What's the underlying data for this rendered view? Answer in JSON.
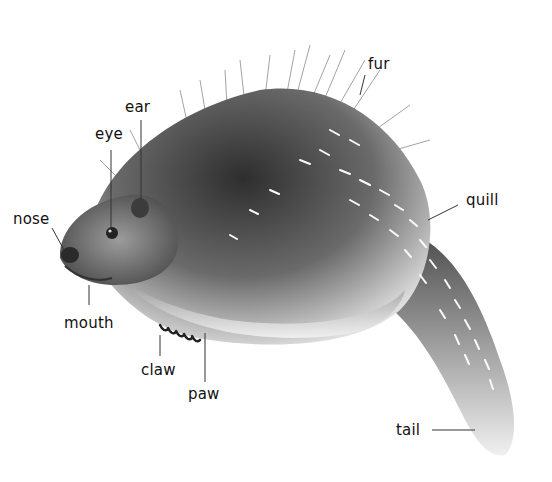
{
  "diagram": {
    "labels": {
      "fur": "fur",
      "ear": "ear",
      "eye": "eye",
      "nose": "nose",
      "quill": "quill",
      "mouth": "mouth",
      "claw": "claw",
      "paw": "paw",
      "tail": "tail"
    },
    "colors": {
      "background": "#ffffff",
      "ink": "#111111",
      "body_dark": "#3a3a3a",
      "body_light": "#d8d8d8"
    }
  }
}
